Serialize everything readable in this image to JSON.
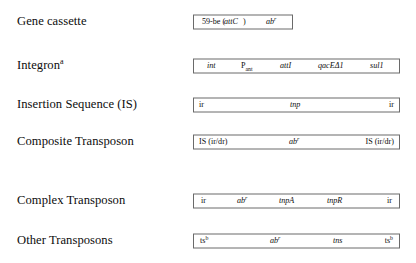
{
  "figure": {
    "border_color": "#6a6a6a",
    "text_color": "#0d0d0d",
    "background": "#ffffff"
  },
  "rows": [
    {
      "label": "Gene cassette",
      "label_sup": "",
      "box": {
        "left": 193,
        "width": 100,
        "top": 14
      },
      "segments": [
        {
          "text": "59-be (",
          "x": 8,
          "style": "roman"
        },
        {
          "text": "attC",
          "x": 30,
          "style": "italic"
        },
        {
          "text": ")",
          "x": 49,
          "style": "roman"
        },
        {
          "text": "ab",
          "x": 72,
          "style": "italic",
          "sup": "r"
        }
      ]
    },
    {
      "label": "Integron",
      "label_sup": "a",
      "box": {
        "left": 193,
        "width": 207,
        "top": 51
      },
      "segments": [
        {
          "text": "int",
          "x": 13,
          "style": "italic"
        },
        {
          "text": "P",
          "x": 47,
          "style": "roman",
          "sub": "ant"
        },
        {
          "text": "attI",
          "x": 86,
          "style": "italic"
        },
        {
          "text": "qacEΔ1",
          "x": 124,
          "style": "italic"
        },
        {
          "text": "sul1",
          "x": 176,
          "style": "italic"
        }
      ]
    },
    {
      "label": "Insertion Sequence (IS)",
      "label_sup": "",
      "box": {
        "left": 193,
        "width": 207,
        "top": 88
      },
      "segments": [
        {
          "text": "ir",
          "x": 5,
          "style": "roman"
        },
        {
          "text": "tnp",
          "x": 96,
          "style": "italic"
        },
        {
          "text": "ir",
          "xr": 5,
          "style": "roman"
        }
      ]
    },
    {
      "label": "Composite Transposon",
      "label_sup": "",
      "box": {
        "left": 193,
        "width": 207,
        "top": 125
      },
      "segments": [
        {
          "text": "IS (ir/dr)",
          "x": 5,
          "style": "roman"
        },
        {
          "text": "ab",
          "x": 95,
          "style": "italic",
          "sup": "r"
        },
        {
          "text": "IS (ir/dr)",
          "xr": 5,
          "style": "roman"
        }
      ]
    },
    {
      "label": "Complex Transposon",
      "label_sup": "",
      "box": {
        "left": 193,
        "width": 207,
        "top": 163
      },
      "segments": [
        {
          "text": "ir",
          "x": 7,
          "style": "roman"
        },
        {
          "text": "ab",
          "x": 43,
          "style": "italic",
          "sup": "r"
        },
        {
          "text": "tnpA",
          "x": 85,
          "style": "italic"
        },
        {
          "text": "tnpR",
          "x": 133,
          "style": "italic"
        },
        {
          "text": "ir",
          "xr": 7,
          "style": "roman"
        }
      ]
    },
    {
      "label": "Other Transposons",
      "label_sup": "",
      "box": {
        "left": 193,
        "width": 207,
        "top": 232
      },
      "segments": [
        {
          "text": "ts",
          "x": 6,
          "style": "roman",
          "sup_roman": "b"
        },
        {
          "text": "ab",
          "x": 76,
          "style": "italic",
          "sup": "r"
        },
        {
          "text": "tns",
          "x": 139,
          "style": "italic"
        },
        {
          "text": "ts",
          "xr": 6,
          "style": "roman",
          "sup_roman": "b"
        }
      ]
    }
  ],
  "row_tops": [
    14,
    51,
    88,
    125,
    163,
    232
  ]
}
